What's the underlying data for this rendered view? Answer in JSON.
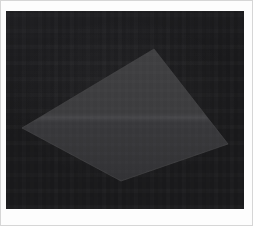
{
  "image": {
    "title": "Dark quadrilateral on near-black background",
    "width": 253,
    "height": 226,
    "outer_margin_color": "#fdfdfd",
    "frame_border_color": "#d6d6d6"
  },
  "content_area": {
    "x": 6,
    "y": 11,
    "width": 238,
    "height": 198,
    "background_color": "#1a1a1c",
    "background_color_secondary": "#202023"
  },
  "shape": {
    "name": "quadrilateral",
    "kind": "kite",
    "fill_color": "#3d3d3f",
    "fill_color_lower": "#37373a",
    "edge_color": "#4a4a4c",
    "seam_color": "#47474a",
    "seam_y": 118,
    "vertices": [
      {
        "label": "left",
        "x": 22,
        "y": 128
      },
      {
        "label": "top",
        "x": 154,
        "y": 49
      },
      {
        "label": "right",
        "x": 228,
        "y": 144
      },
      {
        "label": "bottom",
        "x": 121,
        "y": 181
      }
    ],
    "points_attr": "22,128 154,49 228,144 121,181",
    "seam_points_attr": "33,120 226,115"
  },
  "palette": {
    "background": "#1a1a1c",
    "shape": "#3d3d3f",
    "highlight": "#4a4a4c",
    "page": "#fdfdfd"
  }
}
